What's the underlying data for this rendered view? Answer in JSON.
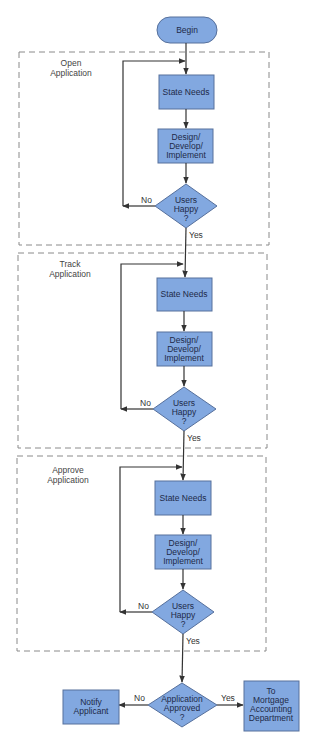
{
  "diagram": {
    "type": "flowchart",
    "colors": {
      "node_fill": "#82a8e0",
      "node_stroke": "#56709c",
      "text": "#1e2a48",
      "edge": "#333333",
      "section_border": "#8a8a8a"
    },
    "start": {
      "label": "Begin"
    },
    "sections": [
      {
        "title_lines": [
          "Open",
          "Application"
        ],
        "step1": "State Needs",
        "step2_lines": [
          "Design/",
          "Develop/",
          "Implement"
        ],
        "decision_lines": [
          "Users",
          "Happy",
          "?"
        ],
        "no_label": "No",
        "yes_label": "Yes"
      },
      {
        "title_lines": [
          "Track",
          "Application"
        ],
        "step1": "State Needs",
        "step2_lines": [
          "Design/",
          "Develop/",
          "Implement"
        ],
        "decision_lines": [
          "Users",
          "Happy",
          "?"
        ],
        "no_label": "No",
        "yes_label": "Yes"
      },
      {
        "title_lines": [
          "Approve",
          "Application"
        ],
        "step1": "State Needs",
        "step2_lines": [
          "Design/",
          "Develop/",
          "Implement"
        ],
        "decision_lines": [
          "Users",
          "Happy",
          "?"
        ],
        "no_label": "No",
        "yes_label": "Yes"
      }
    ],
    "final": {
      "decision_lines": [
        "Application",
        "Approved",
        "?"
      ],
      "no_label": "No",
      "yes_label": "Yes",
      "no_target_lines": [
        "Notify",
        "Applicant"
      ],
      "yes_target_lines": [
        "To",
        "Mortgage",
        "Accounting",
        "Department"
      ]
    }
  }
}
